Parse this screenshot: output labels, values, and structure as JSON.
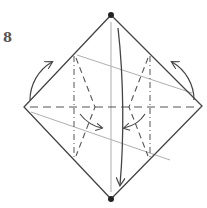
{
  "diagram": {
    "step_number": "8",
    "colors": {
      "outline": "#444444",
      "fold_line": "#555555",
      "thin_line": "#999999",
      "dot": "#222222"
    },
    "shape": "square-diamond",
    "vertices": {
      "top": [
        111,
        15
      ],
      "right": [
        202,
        106
      ],
      "bottom": [
        111,
        199
      ],
      "left": [
        24,
        107
      ]
    },
    "marks": [
      "top-dot",
      "bottom-dot",
      "horizontal-valley-fold",
      "left-mountain-fold",
      "right-mountain-fold",
      "center-vertical-crease",
      "left-curved-arrow-up",
      "right-curved-arrow-up",
      "center-long-arrow-down",
      "inner-left-arrow",
      "inner-right-arrow"
    ]
  }
}
